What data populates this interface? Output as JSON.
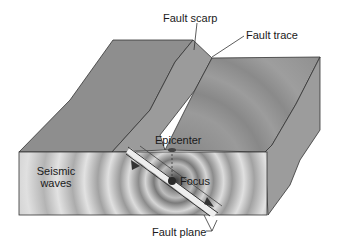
{
  "diagram": {
    "labels": {
      "fault_scarp": "Fault scarp",
      "fault_trace": "Fault trace",
      "epicenter": "Epicenter",
      "focus": "Focus",
      "seismic_waves_line1": "Seismic",
      "seismic_waves_line2": "waves",
      "fault_plane": "Fault plane"
    },
    "colors": {
      "top_surface": "#8f8f8f",
      "front_face_light": "#d9d9d9",
      "front_face_dark": "#9a9a9a",
      "side_face": "#a0a0a0",
      "outline": "#333333",
      "focus_dot": "#2a2a2a"
    }
  }
}
